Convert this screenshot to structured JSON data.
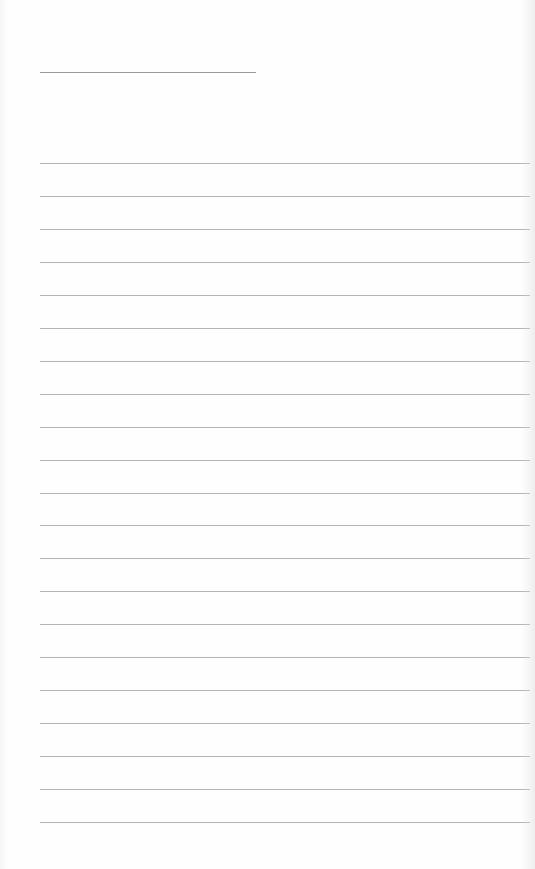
{
  "page": {
    "type": "blank lined writing sheet",
    "title_line": {
      "left": 40,
      "top": 72,
      "width": 216,
      "color": "#9a9a9a"
    },
    "rules": {
      "count": 21,
      "first_top": 163,
      "spacing": 32.95,
      "left": 40,
      "width": 490,
      "color": "#b4b4b4"
    },
    "background": "#fefefe"
  }
}
